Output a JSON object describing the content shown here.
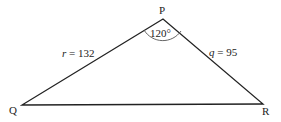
{
  "diagram": {
    "vertices": [
      {
        "name": "P",
        "x": 163,
        "y": 19
      },
      {
        "name": "Q",
        "x": 22,
        "y": 105
      },
      {
        "name": "R",
        "x": 263,
        "y": 104
      }
    ],
    "sides": [
      {
        "var": "r",
        "value": "132",
        "text": "r = 132"
      },
      {
        "var": "q",
        "value": "95",
        "text": "q = 95"
      }
    ],
    "angle": {
      "vertex": "P",
      "text": "120°"
    },
    "labels": {
      "P": "P",
      "Q": "Q",
      "R": "R",
      "r_var": "r",
      "r_eq": " = 132",
      "q_var": "q",
      "q_eq": " = 95",
      "angle_P": "120°"
    },
    "colors": {
      "line": "#222222",
      "arc": "#555555"
    }
  }
}
